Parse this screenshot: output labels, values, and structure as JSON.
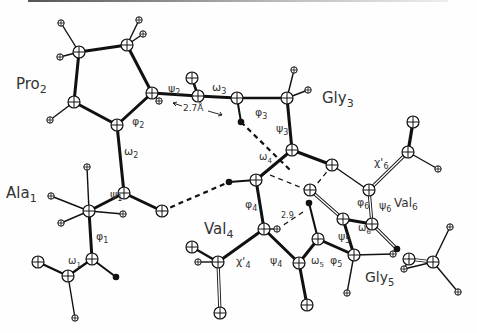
{
  "figure": {
    "type": "molecular ORTEP-style drawing",
    "residue_labels": [
      {
        "id": "pro2",
        "text": "Pro",
        "sub": "2",
        "x": 16,
        "y": 89
      },
      {
        "id": "gly3",
        "text": "Gly",
        "sub": "3",
        "x": 322,
        "y": 103
      },
      {
        "id": "ala1",
        "text": "Ala",
        "sub": "1",
        "x": 6,
        "y": 198
      },
      {
        "id": "val4",
        "text": "Val",
        "sub": "4",
        "x": 204,
        "y": 234
      },
      {
        "id": "val6",
        "text": "Val",
        "sub": "6",
        "x": 394,
        "y": 207
      },
      {
        "id": "gly5",
        "text": "Gly",
        "sub": "5",
        "x": 365,
        "y": 282
      }
    ],
    "torsion_labels": [
      {
        "text": "ψ",
        "sub": "2",
        "x": 168,
        "y": 92
      },
      {
        "text": "ω",
        "sub": "3",
        "x": 212,
        "y": 91
      },
      {
        "text": "φ",
        "sub": "2",
        "x": 132,
        "y": 125
      },
      {
        "text": "ω",
        "sub": "2",
        "x": 124,
        "y": 155
      },
      {
        "text": "φ",
        "sub": "3",
        "x": 255,
        "y": 116
      },
      {
        "text": "ψ",
        "sub": "3",
        "x": 276,
        "y": 132
      },
      {
        "text": "ω",
        "sub": "4",
        "x": 259,
        "y": 160
      },
      {
        "text": "ψ",
        "sub": "1",
        "x": 110,
        "y": 198
      },
      {
        "text": "φ",
        "sub": "1",
        "x": 96,
        "y": 240
      },
      {
        "text": "ω",
        "sub": "1",
        "x": 68,
        "y": 264
      },
      {
        "text": "φ",
        "sub": "4",
        "x": 245,
        "y": 208
      },
      {
        "text": "χ'",
        "sub": "4",
        "x": 236,
        "y": 265
      },
      {
        "text": "ψ",
        "sub": "4",
        "x": 270,
        "y": 264
      },
      {
        "text": "ω",
        "sub": "5",
        "x": 311,
        "y": 264
      },
      {
        "text": "φ",
        "sub": "5",
        "x": 330,
        "y": 264
      },
      {
        "text": "ψ",
        "sub": "5",
        "x": 338,
        "y": 240
      },
      {
        "text": "ω",
        "sub": "6",
        "x": 358,
        "y": 231
      },
      {
        "text": "φ",
        "sub": "6",
        "x": 357,
        "y": 206
      },
      {
        "text": "ψ",
        "sub": "6",
        "x": 379,
        "y": 209
      },
      {
        "text": "χ'",
        "sub": "6",
        "x": 374,
        "y": 166
      }
    ],
    "distance_labels": [
      {
        "text": "2.7Å",
        "x": 183,
        "y": 108
      },
      {
        "text": "2.9",
        "x": 281,
        "y": 218
      }
    ]
  }
}
